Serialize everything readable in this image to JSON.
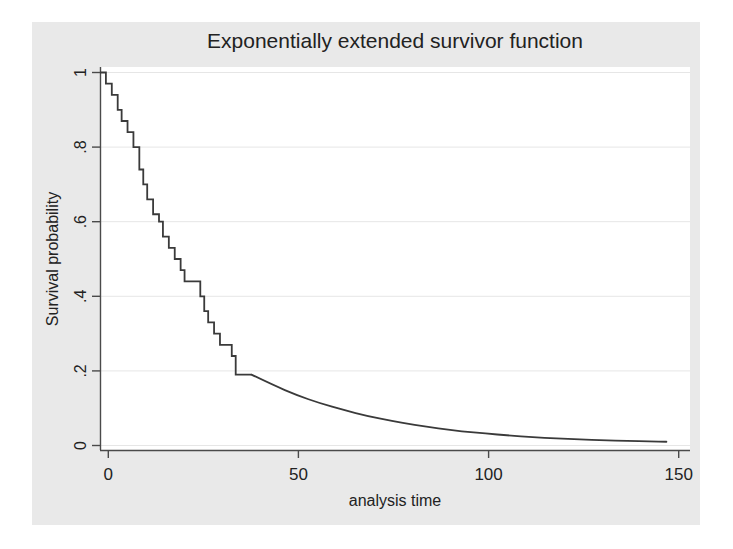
{
  "chart_data": {
    "type": "line",
    "title": "Exponentially extended survivor function",
    "xlabel": "analysis time",
    "ylabel": "Survival probability",
    "xlim": [
      0,
      150
    ],
    "ylim": [
      0,
      1
    ],
    "xticks": [
      0,
      50,
      100,
      150
    ],
    "xticklabels": [
      "0",
      "50",
      "100",
      "150"
    ],
    "yticks": [
      0,
      0.2,
      0.4,
      0.6,
      0.8,
      1
    ],
    "yticklabels": [
      "0",
      ".2",
      ".4",
      ".6",
      ".8",
      "1"
    ],
    "grid": "horizontal",
    "legend": "none",
    "series": [
      {
        "name": "Kaplan-Meier step estimate",
        "style": "step-post",
        "color": "#3a3a3a",
        "points": [
          [
            0,
            1.0
          ],
          [
            1.5,
            0.97
          ],
          [
            3,
            0.94
          ],
          [
            4.5,
            0.9
          ],
          [
            5.5,
            0.87
          ],
          [
            7,
            0.84
          ],
          [
            8.5,
            0.8
          ],
          [
            10,
            0.74
          ],
          [
            11,
            0.7
          ],
          [
            12,
            0.66
          ],
          [
            13.5,
            0.62
          ],
          [
            15,
            0.6
          ],
          [
            16,
            0.56
          ],
          [
            17.5,
            0.53
          ],
          [
            19,
            0.5
          ],
          [
            20.5,
            0.47
          ],
          [
            21.5,
            0.44
          ],
          [
            25.5,
            0.4
          ],
          [
            26.5,
            0.36
          ],
          [
            27.5,
            0.33
          ],
          [
            29,
            0.3
          ],
          [
            30.5,
            0.27
          ],
          [
            33.5,
            0.24
          ],
          [
            34.5,
            0.19
          ],
          [
            38.5,
            0.19
          ]
        ]
      },
      {
        "name": "Exponential extension",
        "style": "smooth",
        "color": "#3a3a3a",
        "points": [
          [
            38.5,
            0.19
          ],
          [
            44,
            0.162
          ],
          [
            50,
            0.135
          ],
          [
            56,
            0.113
          ],
          [
            62,
            0.095
          ],
          [
            68,
            0.079
          ],
          [
            74,
            0.066
          ],
          [
            80,
            0.055
          ],
          [
            86,
            0.046
          ],
          [
            92,
            0.038
          ],
          [
            98,
            0.032
          ],
          [
            104,
            0.027
          ],
          [
            110,
            0.022
          ],
          [
            116,
            0.019
          ],
          [
            122,
            0.016
          ],
          [
            128,
            0.014
          ],
          [
            134,
            0.012
          ],
          [
            140,
            0.011
          ],
          [
            144,
            0.01
          ]
        ]
      }
    ]
  },
  "figure": {
    "background_color": "#ffffff",
    "plot_region_color": "#e9e9e9",
    "plot_area_color": "#ffffff",
    "gridline_color": "#e4e4e4",
    "axis_color": "#4a4a4a",
    "text_color": "#2b2b2b"
  }
}
